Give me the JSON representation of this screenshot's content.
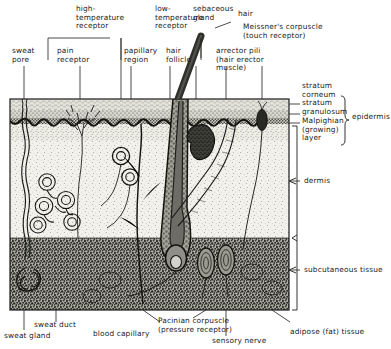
{
  "diagram": {
    "type": "anatomical-cross-section"
  },
  "labels": {
    "high_temperature_receptor": "high-\ntemperature\nreceptor",
    "low_temperature_receptor": "low-\ntemperature\nreceptor",
    "sebaceous_gland": "sebaceous\ngland",
    "hair": "hair",
    "meissners_corpuscle": "Meissner's corpuscle\n(touch receptor)",
    "sweat_pore": "sweat\npore",
    "pain_receptor": "pain\nreceptor",
    "papillary_region": "papillary\nregion",
    "hair_follicle": "hair\nfollicle",
    "arrector_pili": "arrector pili\n(hair erector\nmuscle)",
    "stratum_corneum": "stratum\ncorneum",
    "stratum_granulosum": "stratum\ngranulosum",
    "malpighian_layer": "Malpighian\n(growing)\nlayer",
    "epidermis": "epidermis",
    "dermis": "dermis",
    "subcutaneous_tissue": "subcutaneous tissue",
    "sweat_duct": "sweat duct",
    "sweat_gland": "sweat gland",
    "blood_capillary": "blood capillary",
    "pacinian_corpuscle": "Pacinian corpuscle\n(pressure receptor)",
    "sensory_nerve": "sensory nerve",
    "adipose_tissue": "adipose (fat) tissue"
  },
  "layers": [
    {
      "name": "stratum corneum",
      "top": 99,
      "bottom": 110
    },
    {
      "name": "stratum granulosum",
      "top": 110,
      "bottom": 118
    },
    {
      "name": "Malpighian layer",
      "top": 118,
      "bottom": 124
    },
    {
      "name": "dermis",
      "top": 124,
      "bottom": 238
    },
    {
      "name": "subcutaneous tissue",
      "top": 238,
      "bottom": 310
    }
  ],
  "colors": {
    "ink": "#1b1b1b",
    "epidermis_fill": "#dcdcd6",
    "dermis_fill": "#f0efe9",
    "subcutaneous_fill": "#8d8d86",
    "hair_shaft": "#3a3a38",
    "follicle_fill": "#9a9a93"
  }
}
